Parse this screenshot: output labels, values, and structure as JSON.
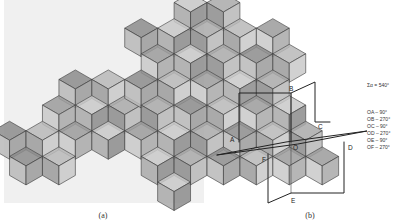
{
  "figure": {
    "panel_a": {
      "caption": "(a)",
      "subject": "photograph of polyhedral model built from stacked cubes (infinite polyhedron)",
      "face_shades": [
        "#c9c9c9",
        "#a9a9a9",
        "#8c8c8c",
        "#b8b8b8",
        "#9b9b9b"
      ],
      "background": "#eeeeee"
    },
    "panel_b": {
      "caption": "(b)",
      "vertex_labels": {
        "A": "A",
        "B": "B",
        "C": "C",
        "D": "D",
        "E": "E",
        "F": "F",
        "O": "O"
      },
      "sum_line": "Σα = 540°",
      "angles": [
        "OA – 90°",
        "OB – 270°",
        "OC – 90°",
        "OD – 270°",
        "OE – 90°",
        "OF – 270°"
      ]
    }
  }
}
